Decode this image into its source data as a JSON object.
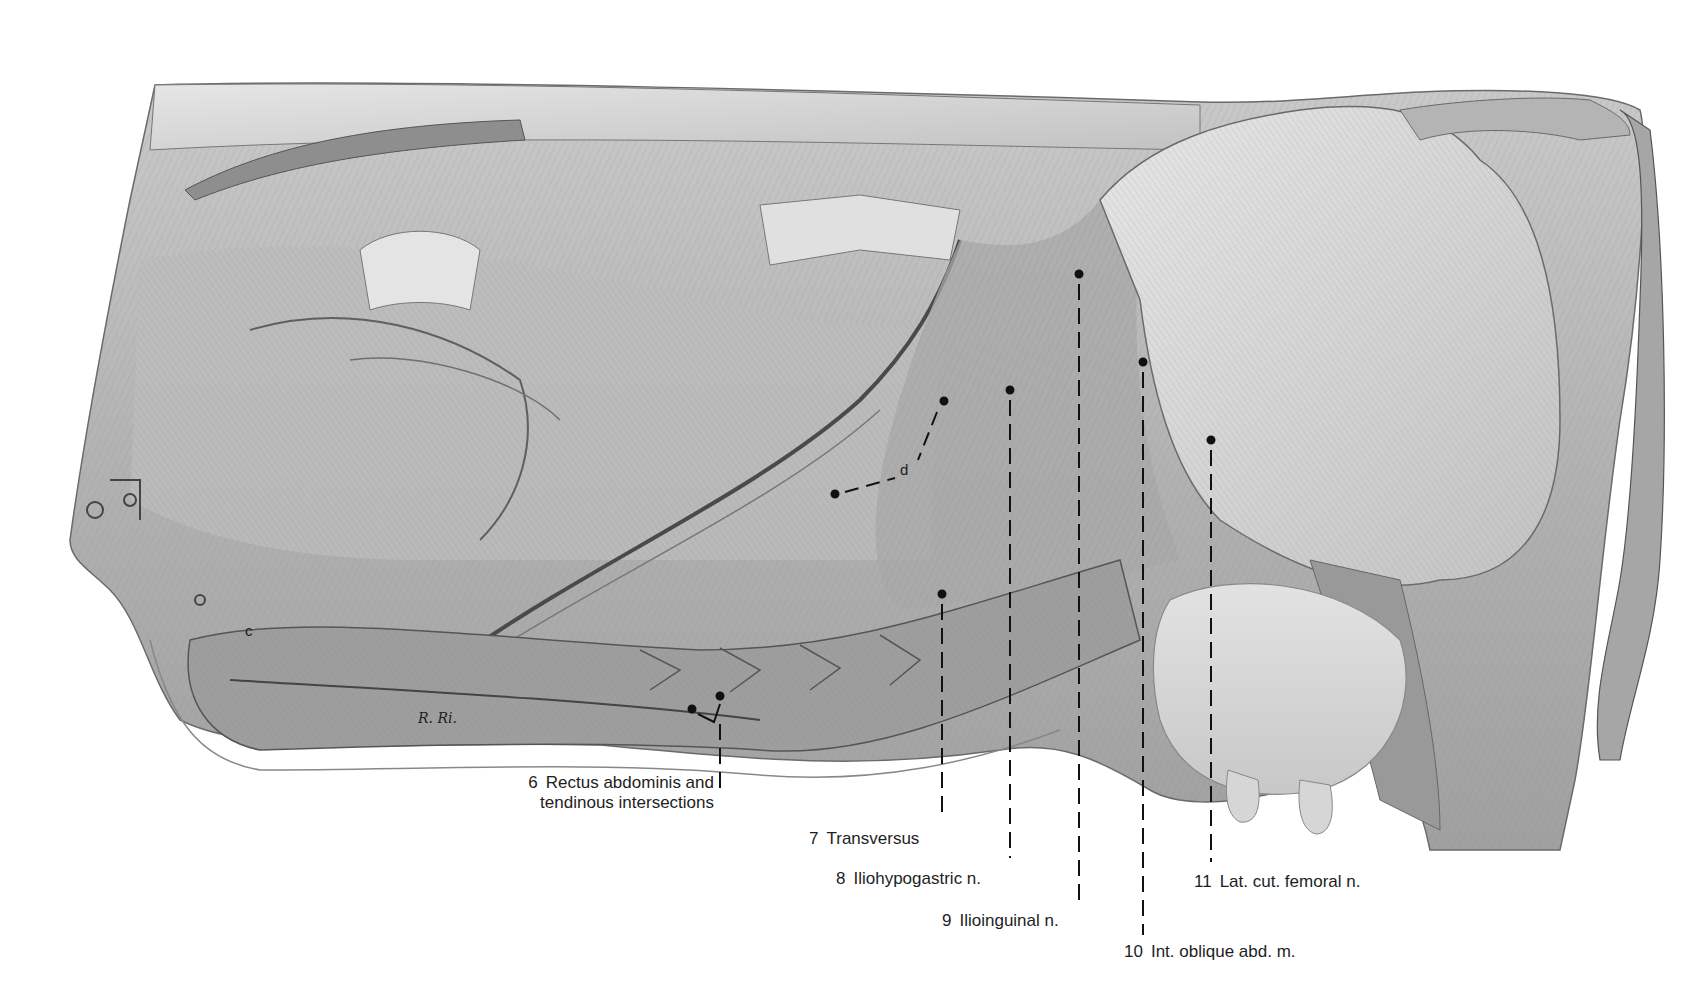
{
  "figure": {
    "signature": "R. Ri.",
    "colors": {
      "background": "#ffffff",
      "ink": "#1e1e1e",
      "shade_dark": "#5a5a5a",
      "shade_mid": "#9a9a9a",
      "shade_light": "#d4d4d4"
    }
  },
  "letters": [
    {
      "id": "c",
      "text": "c"
    },
    {
      "id": "d",
      "text": "d"
    }
  ],
  "labels": [
    {
      "num": "6",
      "line1": "Rectus abdominis and",
      "line2": "tendinous intersections"
    },
    {
      "num": "7",
      "text": "Transversus"
    },
    {
      "num": "8",
      "text": "Iliohypogastric n."
    },
    {
      "num": "9",
      "text": "Ilioinguinal n."
    },
    {
      "num": "10",
      "text": "Int. oblique abd. m."
    },
    {
      "num": "11",
      "text": "Lat. cut. femoral n."
    }
  ]
}
